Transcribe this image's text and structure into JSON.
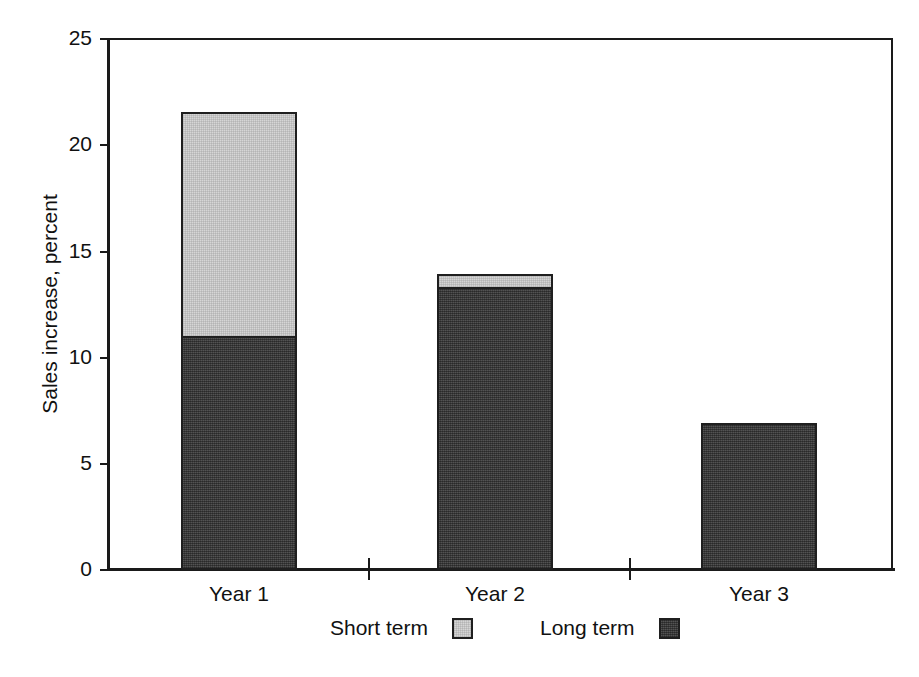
{
  "chart_data": {
    "type": "bar",
    "subtype": "stacked",
    "title": "",
    "xlabel": "",
    "ylabel": "Sales increase, percent",
    "categories": [
      "Year 1",
      "Year 2",
      "Year 3"
    ],
    "series": [
      {
        "name": "Short term",
        "color": "#d6d6d6",
        "values": [
          10.5,
          0.6,
          0.0
        ]
      },
      {
        "name": "Long term",
        "color": "#404040",
        "values": [
          11.0,
          13.3,
          6.9
        ]
      }
    ],
    "totals": [
      21.5,
      13.9,
      6.9
    ],
    "ylim": [
      0,
      25
    ],
    "yticks": [
      0,
      5,
      10,
      15,
      20,
      25
    ],
    "ytick_labels": [
      "0",
      "5",
      "10",
      "15",
      "20",
      "25"
    ],
    "grid": false,
    "legend_position": "bottom",
    "legend": [
      {
        "label": "Short term",
        "swatch": "#d6d6d6"
      },
      {
        "label": "Long term",
        "swatch": "#404040"
      }
    ]
  },
  "axes": {
    "y_title": "Sales increase, percent",
    "y_ticks": [
      {
        "value": "25"
      },
      {
        "value": "20"
      },
      {
        "value": "15"
      },
      {
        "value": "10"
      },
      {
        "value": "5"
      },
      {
        "value": "0"
      }
    ],
    "x_labels": [
      {
        "text": "Year 1"
      },
      {
        "text": "Year 2"
      },
      {
        "text": "Year 3"
      }
    ]
  },
  "legend": {
    "short": {
      "label": "Short term"
    },
    "long": {
      "label": "Long term"
    }
  },
  "colors": {
    "short_term": "#d6d6d6",
    "long_term": "#404040",
    "axis": "#1a1a1a",
    "text": "#111111",
    "background": "#ffffff"
  }
}
